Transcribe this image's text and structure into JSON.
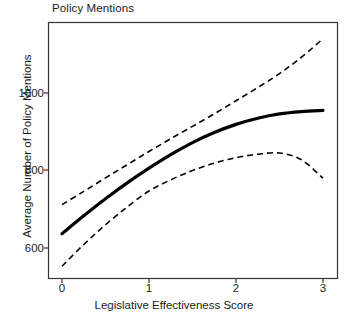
{
  "chart_data": {
    "type": "line",
    "title": "Policy Mentions",
    "xlabel": "Legislative Effectiveness Score",
    "ylabel": "Average Number of Policy Mentions",
    "xlim": [
      -0.07,
      3.12
    ],
    "ylim": [
      530,
      1160
    ],
    "xticks": [
      0,
      1,
      2,
      3
    ],
    "xtick_labels": [
      "0",
      "1",
      "2",
      "3"
    ],
    "yticks": [
      600,
      800,
      1000
    ],
    "ytick_labels": [
      "600",
      "800",
      "1000"
    ],
    "grid": false,
    "legend": null,
    "x": [
      0,
      0.25,
      0.5,
      0.75,
      1,
      1.25,
      1.5,
      1.75,
      2,
      2.25,
      2.5,
      2.75,
      3
    ],
    "series": [
      {
        "name": "Predicted mean",
        "style": "solid",
        "color": "#000000",
        "width": 3.2,
        "values": [
          637,
          683,
          727,
          768,
          806,
          841,
          872,
          898,
          919,
          935,
          946,
          952,
          955
        ]
      },
      {
        "name": "Upper 95% confidence bound",
        "style": "dashed",
        "color": "#000000",
        "width": 1.6,
        "values": [
          712,
          746,
          781,
          815,
          849,
          882,
          914,
          946,
          980,
          1014,
          1050,
          1092,
          1140
        ]
      },
      {
        "name": "Lower 95% confidence bound",
        "style": "dashed",
        "color": "#000000",
        "width": 1.6,
        "values": [
          553,
          609,
          660,
          706,
          747,
          776,
          800,
          819,
          833,
          842,
          845,
          828,
          780
        ]
      }
    ],
    "annotations": []
  },
  "figure": {
    "background_color": "#ffffff",
    "axis_color": "#333333",
    "panel_border": true
  }
}
